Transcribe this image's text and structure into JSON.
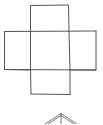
{
  "diagram": {
    "description": "Cross-shaped net of squares (cube net) with the apex of a pyramid below",
    "stroke_color": "#555555",
    "background": "#ffffff",
    "cross_net": {
      "faces": [
        {
          "name": "top",
          "x": 30,
          "y": 5,
          "w": 39,
          "h": 26
        },
        {
          "name": "left",
          "x": 4,
          "y": 31,
          "w": 26,
          "h": 39
        },
        {
          "name": "center",
          "x": 30,
          "y": 31,
          "w": 39,
          "h": 39
        },
        {
          "name": "right",
          "x": 69,
          "y": 31,
          "w": 27,
          "h": 39
        },
        {
          "name": "bottom",
          "x": 31,
          "y": 70,
          "w": 39,
          "h": 24
        }
      ]
    },
    "pyramid_apex": {
      "apex": {
        "x": 61,
        "y": 114
      },
      "left_base": {
        "x": 45,
        "y": 124
      },
      "right_base": {
        "x": 77,
        "y": 124
      }
    }
  }
}
